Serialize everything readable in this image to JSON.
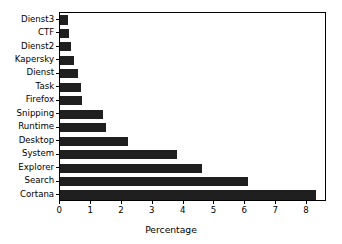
{
  "chart_data": {
    "type": "bar",
    "orientation": "horizontal",
    "title": "",
    "xlabel": "Percentage",
    "ylabel": "",
    "xlim": [
      0,
      8.65
    ],
    "xticks": [
      "0",
      "1",
      "2",
      "3",
      "4",
      "5",
      "6",
      "7",
      "8"
    ],
    "xtick_values": [
      0,
      1,
      2,
      3,
      4,
      5,
      6,
      7,
      8
    ],
    "grid": false,
    "legend": null,
    "bar_color": "#1f1f1f",
    "background_color": "#ffffff",
    "axes_edge_color": "#000000",
    "categories": [
      "Dienst3",
      "CTF",
      "Dienst2",
      "Kapersky",
      "Dienst",
      "Task",
      "Firefox",
      "Snipping",
      "Runtime",
      "Desktop",
      "System",
      "Explorer",
      "Search",
      "Cortana"
    ],
    "values": [
      0.25,
      0.27,
      0.35,
      0.44,
      0.56,
      0.66,
      0.69,
      1.37,
      1.48,
      2.2,
      3.78,
      4.6,
      6.1,
      8.3
    ]
  }
}
